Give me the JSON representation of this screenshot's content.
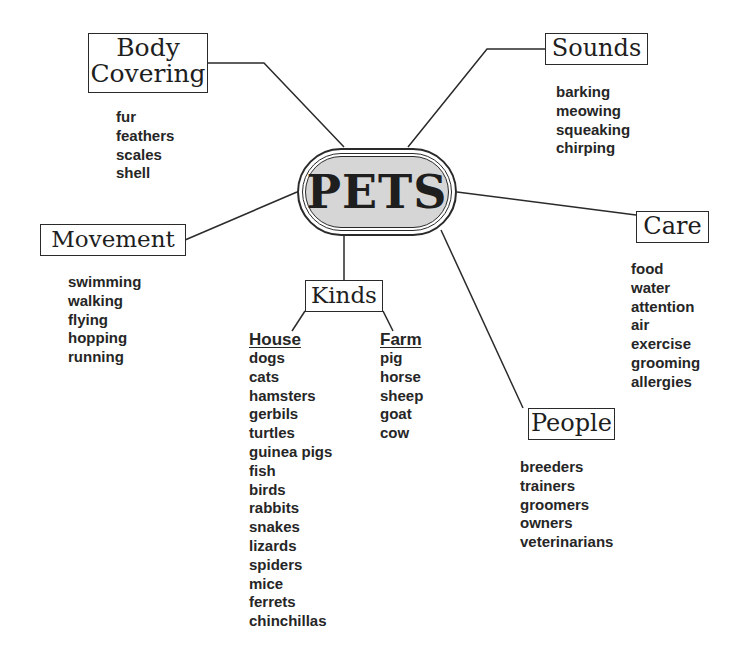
{
  "center": {
    "label": "PETS",
    "fill_color": "#d6d6d6"
  },
  "branches": {
    "body_covering": {
      "title_line1": "Body",
      "title_line2": "Covering",
      "items": [
        "fur",
        "feathers",
        "scales",
        "shell"
      ]
    },
    "sounds": {
      "title": "Sounds",
      "items": [
        "barking",
        "meowing",
        "squeaking",
        "chirping"
      ]
    },
    "movement": {
      "title": "Movement",
      "items": [
        "swimming",
        "walking",
        "flying",
        "hopping",
        "running"
      ]
    },
    "care": {
      "title": "Care",
      "items": [
        "food",
        "water",
        "attention",
        "air",
        "exercise",
        "grooming",
        "allergies"
      ]
    },
    "kinds": {
      "title": "Kinds",
      "house": {
        "heading": "House",
        "items": [
          "dogs",
          "cats",
          "hamsters",
          "gerbils",
          "turtles",
          "guinea pigs",
          "fish",
          "birds",
          "rabbits",
          "snakes",
          "lizards",
          "spiders",
          "mice",
          "ferrets",
          "chinchillas"
        ]
      },
      "farm": {
        "heading": "Farm",
        "items": [
          "pig",
          "horse",
          "sheep",
          "goat",
          "cow"
        ]
      }
    },
    "people": {
      "title": "People",
      "items": [
        "breeders",
        "trainers",
        "groomers",
        "owners",
        "veterinarians"
      ]
    }
  }
}
